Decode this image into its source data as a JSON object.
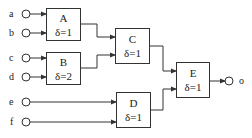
{
  "diagram": {
    "inputs": [
      {
        "id": "a",
        "label": "a"
      },
      {
        "id": "b",
        "label": "b"
      },
      {
        "id": "c",
        "label": "c"
      },
      {
        "id": "d",
        "label": "d"
      },
      {
        "id": "e",
        "label": "e"
      },
      {
        "id": "f",
        "label": "f"
      }
    ],
    "nodes": [
      {
        "id": "A",
        "name": "A",
        "delay": "δ=1",
        "inputs": [
          "a",
          "b"
        ],
        "output_to": "C"
      },
      {
        "id": "B",
        "name": "B",
        "delay": "δ=2",
        "inputs": [
          "c",
          "d"
        ],
        "output_to": "C"
      },
      {
        "id": "C",
        "name": "C",
        "delay": "δ=1",
        "inputs": [
          "A",
          "B"
        ],
        "output_to": "E"
      },
      {
        "id": "D",
        "name": "D",
        "delay": "δ=1",
        "inputs": [
          "e",
          "f"
        ],
        "output_to": "E"
      },
      {
        "id": "E",
        "name": "E",
        "delay": "δ=1",
        "inputs": [
          "C",
          "D"
        ],
        "output_to": "o"
      }
    ],
    "output": {
      "id": "o",
      "label": "o"
    },
    "colors": {
      "line": "#333333",
      "background": "#ffffff"
    }
  }
}
